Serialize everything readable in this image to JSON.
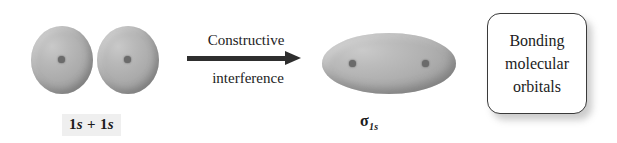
{
  "figure": {
    "reactant_label_prefix": "1",
    "reactant_label_s1": "s",
    "reactant_label_plus": " + 1",
    "reactant_label_s2": "s",
    "reactant_label_full": "1s + 1s",
    "product_sigma_symbol": "σ",
    "product_sigma_subscript": "1s",
    "arrow": {
      "caption_top": "Constructive",
      "caption_bottom": "interference",
      "direction": "right"
    },
    "callout": {
      "line1": "Bonding",
      "line2": "molecular",
      "line3": "orbitals"
    },
    "colors": {
      "orbital_fill": "#afafaf",
      "orbital_highlight": "#cacaca",
      "orbital_edge": "#909090",
      "nucleus": "#6b6b6b",
      "arrow": "#2e2e2e",
      "callout_border": "#3a3a3a",
      "text": "#1c1c1c",
      "background": "#ffffff"
    }
  }
}
